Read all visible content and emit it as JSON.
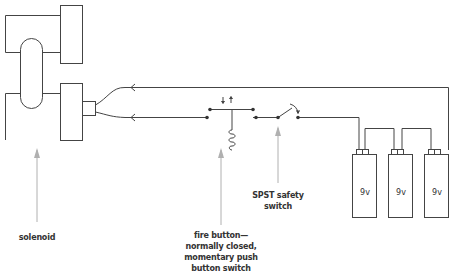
{
  "diagram": {
    "type": "circuit",
    "components": {
      "solenoid": {
        "label": "solenoid"
      },
      "fire_button": {
        "label_lines": [
          "fire button—",
          "normally closed,",
          "momentary push",
          "button switch"
        ]
      },
      "safety_switch": {
        "label": "SPST safety switch"
      },
      "batteries": [
        {
          "label": "9v"
        },
        {
          "label": "9v"
        },
        {
          "label": "9v"
        }
      ]
    },
    "colors": {
      "line": "#444444",
      "pointer": "#b0b0b0",
      "text": "#333333"
    }
  }
}
